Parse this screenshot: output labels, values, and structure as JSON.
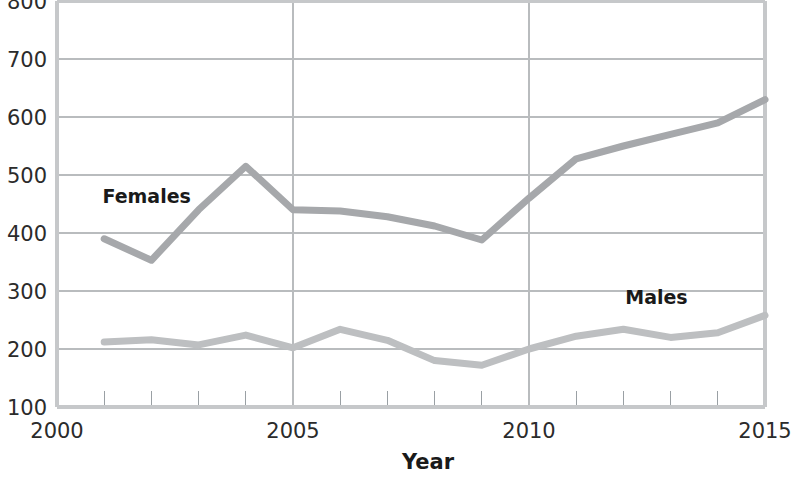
{
  "chart_data": {
    "type": "line",
    "title": "",
    "subtitle": "",
    "xlabel": "Year",
    "ylabel": "",
    "x": [
      2001,
      2002,
      2003,
      2004,
      2005,
      2006,
      2007,
      2008,
      2009,
      2010,
      2011,
      2012,
      2013,
      2014,
      2015
    ],
    "xlim": [
      2000,
      2015
    ],
    "ylim": [
      100,
      800
    ],
    "grid": true,
    "legend_position": "inline-annotations",
    "x_tick_labels": [
      "2000",
      "2005",
      "2010",
      "2015"
    ],
    "x_tick_values": [
      2000,
      2005,
      2010,
      2015
    ],
    "x_minor_ticks": [
      2001,
      2002,
      2003,
      2004,
      2006,
      2007,
      2008,
      2009,
      2011,
      2012,
      2013,
      2014
    ],
    "y_tick_labels": [
      "100",
      "200",
      "300",
      "400",
      "500",
      "600",
      "700",
      "800"
    ],
    "y_tick_values": [
      100,
      200,
      300,
      400,
      500,
      600,
      700,
      800
    ],
    "series": [
      {
        "name": "Females",
        "color": "#a6a8ab",
        "label_x": 2001.9,
        "label_y": 452,
        "values": [
          390,
          353,
          440,
          515,
          440,
          438,
          428,
          412,
          388,
          460,
          528,
          550,
          570,
          590,
          630
        ]
      },
      {
        "name": "Males",
        "color": "#bdbfc1",
        "label_x": 2012.7,
        "label_y": 278,
        "values": [
          212,
          216,
          207,
          224,
          202,
          234,
          215,
          180,
          172,
          200,
          222,
          234,
          220,
          228,
          258
        ]
      }
    ]
  },
  "annotations": {
    "females_label": "Females",
    "males_label": "Males"
  }
}
